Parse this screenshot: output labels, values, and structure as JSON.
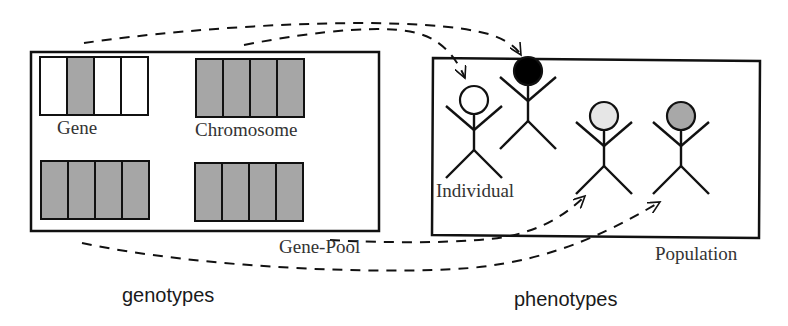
{
  "genotypes": {
    "caption": "genotypes",
    "box_label": "Gene-Pool",
    "gene_label": "Gene",
    "chromosome_label": "Chromosome",
    "blocks": [
      {
        "name": "gene-chromosome",
        "x": 40,
        "y": 57,
        "cells": [
          "white",
          "gray",
          "white",
          "white"
        ]
      },
      {
        "name": "chromosome-1",
        "x": 196,
        "y": 59,
        "cells": [
          "gray",
          "gray",
          "gray",
          "gray"
        ]
      },
      {
        "name": "chromosome-2",
        "x": 41,
        "y": 161,
        "cells": [
          "gray",
          "gray",
          "gray",
          "gray"
        ]
      },
      {
        "name": "chromosome-3",
        "x": 195,
        "y": 163,
        "cells": [
          "gray",
          "gray",
          "gray",
          "gray"
        ]
      }
    ]
  },
  "phenotypes": {
    "caption": "phenotypes",
    "box_label": "Population",
    "individual_label": "Individual",
    "individuals": [
      {
        "name": "individual-white",
        "head_color": "#ffffff",
        "x": 474,
        "y": 100
      },
      {
        "name": "individual-black",
        "head_color": "#000000",
        "x": 528,
        "y": 71
      },
      {
        "name": "individual-lightgray",
        "head_color": "#e6e6e6",
        "x": 604,
        "y": 116
      },
      {
        "name": "individual-gray",
        "head_color": "#a8a8a8",
        "x": 681,
        "y": 116
      }
    ]
  },
  "colors": {
    "gene_gray": "#a6a6a6",
    "stroke": "#111111",
    "background": "#ffffff"
  }
}
